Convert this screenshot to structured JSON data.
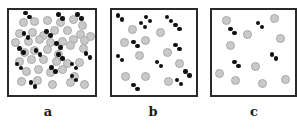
{
  "figure": {
    "panels": [
      {
        "id": "a",
        "label": "a",
        "box": {
          "x": 7,
          "y": 8,
          "w": 90,
          "h": 89
        },
        "label_pos": {
          "x": 38,
          "y": 104
        },
        "gray_particles": [
          [
            17,
            15
          ],
          [
            30,
            14
          ],
          [
            45,
            12
          ],
          [
            60,
            15
          ],
          [
            75,
            11
          ],
          [
            86,
            18
          ],
          [
            12,
            28
          ],
          [
            27,
            26
          ],
          [
            40,
            30
          ],
          [
            53,
            24
          ],
          [
            68,
            24
          ],
          [
            83,
            29
          ],
          [
            95,
            31
          ],
          [
            8,
            38
          ],
          [
            23,
            37
          ],
          [
            35,
            35
          ],
          [
            48,
            38
          ],
          [
            62,
            37
          ],
          [
            75,
            35
          ],
          [
            88,
            36
          ],
          [
            18,
            50
          ],
          [
            30,
            48
          ],
          [
            45,
            47
          ],
          [
            58,
            52
          ],
          [
            72,
            42
          ],
          [
            87,
            45
          ],
          [
            12,
            60
          ],
          [
            26,
            58
          ],
          [
            40,
            58
          ],
          [
            55,
            61
          ],
          [
            68,
            63
          ],
          [
            82,
            62
          ],
          [
            20,
            72
          ],
          [
            34,
            70
          ],
          [
            48,
            73
          ],
          [
            62,
            70
          ],
          [
            76,
            78
          ],
          [
            14,
            84
          ],
          [
            33,
            83
          ],
          [
            50,
            88
          ],
          [
            72,
            85
          ],
          [
            88,
            88
          ]
        ],
        "dimers": [
          [
            22,
            6
          ],
          [
            60,
            8
          ],
          [
            82,
            8
          ],
          [
            20,
            30
          ],
          [
            46,
            28
          ],
          [
            15,
            48
          ],
          [
            34,
            50
          ],
          [
            58,
            42
          ],
          [
            60,
            55
          ],
          [
            92,
            54
          ],
          [
            12,
            66
          ],
          [
            52,
            70
          ],
          [
            76,
            66
          ],
          [
            76,
            80
          ],
          [
            28,
            88
          ]
        ]
      },
      {
        "id": "b",
        "label": "b",
        "box": {
          "x": 110,
          "y": 8,
          "w": 88,
          "h": 89
        },
        "label_pos": {
          "x": 143,
          "y": 104
        },
        "gray_particles": [
          [
            24,
            23
          ],
          [
            58,
            27
          ],
          [
            15,
            38
          ],
          [
            40,
            36
          ],
          [
            66,
            50
          ],
          [
            33,
            54
          ],
          [
            80,
            63
          ],
          [
            16,
            78
          ],
          [
            40,
            78
          ],
          [
            67,
            84
          ]
        ],
        "dimers": [
          [
            10,
            9
          ],
          [
            43,
            11
          ],
          [
            68,
            11
          ],
          [
            78,
            20
          ],
          [
            37,
            18
          ],
          [
            28,
            40
          ],
          [
            78,
            44
          ],
          [
            10,
            57
          ],
          [
            56,
            64
          ],
          [
            80,
            85
          ],
          [
            28,
            91
          ],
          [
            90,
            75
          ]
        ]
      },
      {
        "id": "c",
        "label": "c",
        "box": {
          "x": 210,
          "y": 8,
          "w": 87,
          "h": 89
        },
        "label_pos": {
          "x": 244,
          "y": 104
        },
        "gray_particles": [
          [
            17,
            12
          ],
          [
            75,
            10
          ],
          [
            43,
            29
          ],
          [
            83,
            34
          ],
          [
            22,
            42
          ],
          [
            52,
            66
          ],
          [
            9,
            75
          ],
          [
            28,
            83
          ],
          [
            61,
            86
          ],
          [
            89,
            82
          ]
        ],
        "dimers": [
          [
            25,
            25
          ],
          [
            58,
            18
          ],
          [
            30,
            64
          ],
          [
            75,
            55
          ]
        ]
      }
    ]
  },
  "legend": {
    "gray_particle": "gray-circle",
    "dimer": "black-dimer"
  },
  "colors": {
    "border": "#2a2a2a",
    "gray_fill": "#c9c9c9",
    "gray_rim": "#a9a9a9",
    "dimer": "#111111",
    "label": "#1a1a1a"
  }
}
